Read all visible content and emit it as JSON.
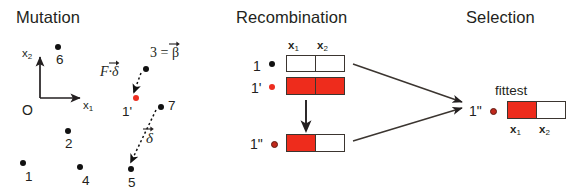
{
  "figure": {
    "width": 575,
    "height": 195,
    "background": "#ffffff",
    "colors": {
      "ink": "#231f20",
      "red": "#ee2c1c",
      "dark_red": "#c0281c",
      "box_border": "#3b3530"
    }
  },
  "panels": {
    "mutation": {
      "title": "Mutation",
      "axes": {
        "origin_label": "O",
        "x_axis_label": "x",
        "x_axis_sub": "1",
        "y_axis_label": "x",
        "y_axis_sub": "2"
      },
      "points": [
        {
          "id": "p6",
          "label": "6",
          "x": 55,
          "y": 44,
          "color": "black"
        },
        {
          "id": "p3",
          "label": "3",
          "x": 143,
          "y": 66,
          "color": "black"
        },
        {
          "id": "p1prime",
          "label": "1'",
          "x": 133,
          "y": 95,
          "color": "red"
        },
        {
          "id": "p7",
          "label": "7",
          "x": 158,
          "y": 104,
          "color": "black"
        },
        {
          "id": "p2",
          "label": "2",
          "x": 65,
          "y": 128,
          "color": "black"
        },
        {
          "id": "p1",
          "label": "1",
          "x": 20,
          "y": 160,
          "color": "black"
        },
        {
          "id": "p4",
          "label": "4",
          "x": 77,
          "y": 164,
          "color": "black"
        },
        {
          "id": "p5",
          "label": "5",
          "x": 128,
          "y": 166,
          "color": "black"
        }
      ],
      "vectors": [
        {
          "id": "F-delta",
          "label": "F·δ",
          "arrow_from": "3",
          "arrow_to": "1'"
        },
        {
          "id": "delta",
          "label": "δ",
          "arrow_from": "7",
          "arrow_to": "5"
        }
      ],
      "annotations": [
        {
          "id": "beta-equation",
          "text": "3 = β"
        }
      ]
    },
    "recombination": {
      "title": "Recombination",
      "column_headers": [
        {
          "label": "x",
          "sub": "1"
        },
        {
          "label": "x",
          "sub": "2"
        }
      ],
      "rows": [
        {
          "id": "row-1",
          "label": "1",
          "dot_color": "black",
          "cells": [
            "white",
            "white"
          ]
        },
        {
          "id": "row-1p",
          "label": "1'",
          "dot_color": "red",
          "cells": [
            "red",
            "red"
          ]
        },
        {
          "id": "row-1pp",
          "label": "1\"",
          "dot_color": "dark-red",
          "cells": [
            "red",
            "white"
          ]
        }
      ],
      "crossover_arrow": "down-arrow"
    },
    "selection": {
      "title": "Selection",
      "fittest_label": "fittest",
      "result": {
        "id": "result-1pp",
        "label": "1\"",
        "dot_color": "dark-red",
        "cells": [
          "red",
          "white"
        ]
      },
      "column_headers": [
        {
          "label": "x",
          "sub": "1"
        },
        {
          "label": "x",
          "sub": "2"
        }
      ],
      "incoming_arrows": 2
    }
  }
}
